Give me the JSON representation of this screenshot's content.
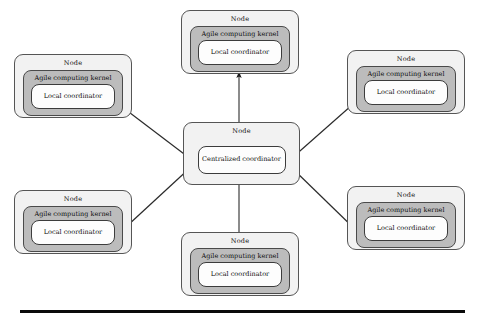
{
  "diagram": {
    "labels": {
      "node": "Node",
      "kernel": "Agile computing kernel",
      "local_coordinator": "Local coordinator",
      "centralized_coordinator": "Centralized coordinator"
    },
    "colors": {
      "node_fill": "#f2f2f2",
      "kernel_fill": "#bcbcbc",
      "coordinator_fill": "#fdfdfd",
      "stroke": "#555555",
      "arrow": "#1a1a1a",
      "rule": "#0a0a0a",
      "background": "#ffffff"
    },
    "nodes": [
      {
        "id": "node-top",
        "node_label": "Node",
        "kernel_label": "Agile computing kernel",
        "coordinator_label": "Local coordinator"
      },
      {
        "id": "node-left-top",
        "node_label": "Node",
        "kernel_label": "Agile computing kernel",
        "coordinator_label": "Local coordinator"
      },
      {
        "id": "node-right-top",
        "node_label": "Node",
        "kernel_label": "Agile computing kernel",
        "coordinator_label": "Local coordinator"
      },
      {
        "id": "node-left-bottom",
        "node_label": "Node",
        "kernel_label": "Agile computing kernel",
        "coordinator_label": "Local coordinator"
      },
      {
        "id": "node-right-bottom",
        "node_label": "Node",
        "kernel_label": "Agile computing kernel",
        "coordinator_label": "Local coordinator"
      },
      {
        "id": "node-bottom",
        "node_label": "Node",
        "kernel_label": "Agile computing kernel",
        "coordinator_label": "Local coordinator"
      }
    ],
    "center_node": {
      "id": "node-center",
      "node_label": "Node",
      "coordinator_label": "Centralized coordinator"
    },
    "connections": [
      {
        "from": "node-top",
        "to": "node-center",
        "direction": "bidirectional"
      },
      {
        "from": "node-bottom",
        "to": "node-center",
        "direction": "bidirectional"
      },
      {
        "from": "node-left-top",
        "to": "node-center",
        "direction": "bidirectional"
      },
      {
        "from": "node-right-top",
        "to": "node-center",
        "direction": "bidirectional"
      },
      {
        "from": "node-left-bottom",
        "to": "node-center",
        "direction": "bidirectional"
      },
      {
        "from": "node-right-bottom",
        "to": "node-center",
        "direction": "bidirectional"
      }
    ]
  }
}
